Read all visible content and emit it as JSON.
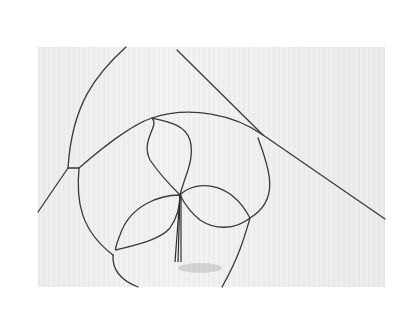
{
  "image": {
    "subject": "wire sculpture of a three-leaf clover inside a loop frame",
    "background": "white ribbed paper",
    "colors": {
      "wire": "#3a3a3a",
      "paper": "#efefef",
      "page": "#ffffff"
    }
  }
}
